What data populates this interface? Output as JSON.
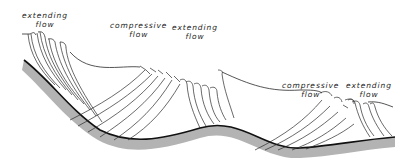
{
  "diagram": {
    "type": "glacier flow cross-section",
    "labels": [
      {
        "id": "extending-1",
        "line1": "extending",
        "line2": "flow",
        "x": 26,
        "y": 12
      },
      {
        "id": "compressive-1",
        "line1": "compressive",
        "line2": "flow",
        "x": 118,
        "y": 22
      },
      {
        "id": "extending-2",
        "line1": "extending",
        "line2": "flow",
        "x": 172,
        "y": 24
      },
      {
        "id": "compressive-2",
        "line1": "compressive",
        "line2": "flow",
        "x": 282,
        "y": 82
      },
      {
        "id": "extending-3",
        "line1": "extending",
        "line2": "flow",
        "x": 346,
        "y": 82
      }
    ],
    "colors": {
      "bed_fill": "#b3b3b3",
      "bed_line": "#111111",
      "crevasse_line": "#2a2a2a",
      "background": "#ffffff"
    }
  }
}
